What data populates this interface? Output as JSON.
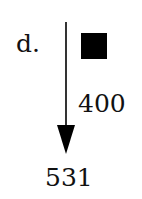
{
  "diagram": {
    "label": "d.",
    "edge_value": "400",
    "result": "531",
    "marker": "filled-square",
    "colors": {
      "ink": "#000000",
      "background": "#ffffff"
    }
  }
}
